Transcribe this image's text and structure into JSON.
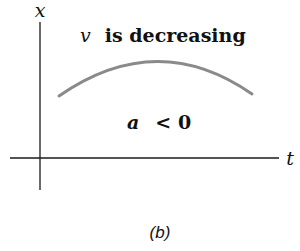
{
  "figure": {
    "panel_label": "(b)",
    "axes": {
      "vertical_label": "x",
      "horizontal_label": "t"
    },
    "annotations": {
      "top_text_var": "v",
      "top_text_rest": "is decreasing",
      "bottom_text_var": "a",
      "bottom_text_rest": "< 0"
    },
    "curve": {
      "description": "concave-down arc (x vs t)",
      "color": "#8a8a8a",
      "start": [
        59,
        96
      ],
      "peak": [
        160,
        63
      ],
      "end": [
        252,
        94
      ]
    },
    "colors": {
      "axis": "#1a1a1a",
      "text": "#111111",
      "curve": "#8a8a8a"
    }
  }
}
